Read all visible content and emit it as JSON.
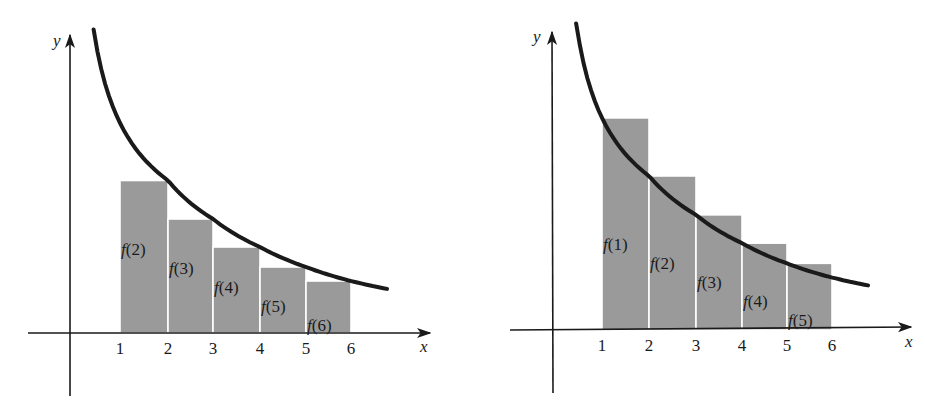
{
  "chart_data": [
    {
      "type": "bar",
      "title": "",
      "description": "Right-endpoint rectangles under decreasing curve y = f(x) (lower sum)",
      "xlabel": "x",
      "ylabel": "y",
      "x_ticks": [
        "1",
        "2",
        "3",
        "4",
        "5",
        "6"
      ],
      "bars": [
        {
          "x_start": 1,
          "x_end": 2,
          "value": 3.05,
          "label_fn": "f",
          "label_arg": "(2)"
        },
        {
          "x_start": 2,
          "x_end": 3,
          "value": 2.28,
          "label_fn": "f",
          "label_arg": "(3)"
        },
        {
          "x_start": 3,
          "x_end": 4,
          "value": 1.72,
          "label_fn": "f",
          "label_arg": "(4)"
        },
        {
          "x_start": 4,
          "x_end": 5,
          "value": 1.32,
          "label_fn": "f",
          "label_arg": "(5)"
        },
        {
          "x_start": 5,
          "x_end": 6,
          "value": 1.04,
          "label_fn": "f",
          "label_arg": "(6)"
        }
      ],
      "curve": {
        "name": "y = f(x)",
        "x_range": [
          0.45,
          6.8
        ]
      },
      "grid": false
    },
    {
      "type": "bar",
      "title": "",
      "description": "Left-endpoint rectangles under decreasing curve y = f(x) (upper sum)",
      "xlabel": "x",
      "ylabel": "y",
      "x_ticks": [
        "1",
        "2",
        "3",
        "4",
        "5",
        "6"
      ],
      "bars": [
        {
          "x_start": 1,
          "x_end": 2,
          "value": 4.2,
          "label_fn": "f",
          "label_arg": "(1)"
        },
        {
          "x_start": 2,
          "x_end": 3,
          "value": 3.05,
          "label_fn": "f",
          "label_arg": "(2)"
        },
        {
          "x_start": 3,
          "x_end": 4,
          "value": 2.28,
          "label_fn": "f",
          "label_arg": "(3)"
        },
        {
          "x_start": 4,
          "x_end": 5,
          "value": 1.72,
          "label_fn": "f",
          "label_arg": "(4)"
        },
        {
          "x_start": 5,
          "x_end": 6,
          "value": 1.32,
          "label_fn": "f",
          "label_arg": "(5)"
        }
      ],
      "curve": {
        "name": "y = f(x)",
        "x_range": [
          0.45,
          6.8
        ]
      },
      "grid": false
    }
  ]
}
